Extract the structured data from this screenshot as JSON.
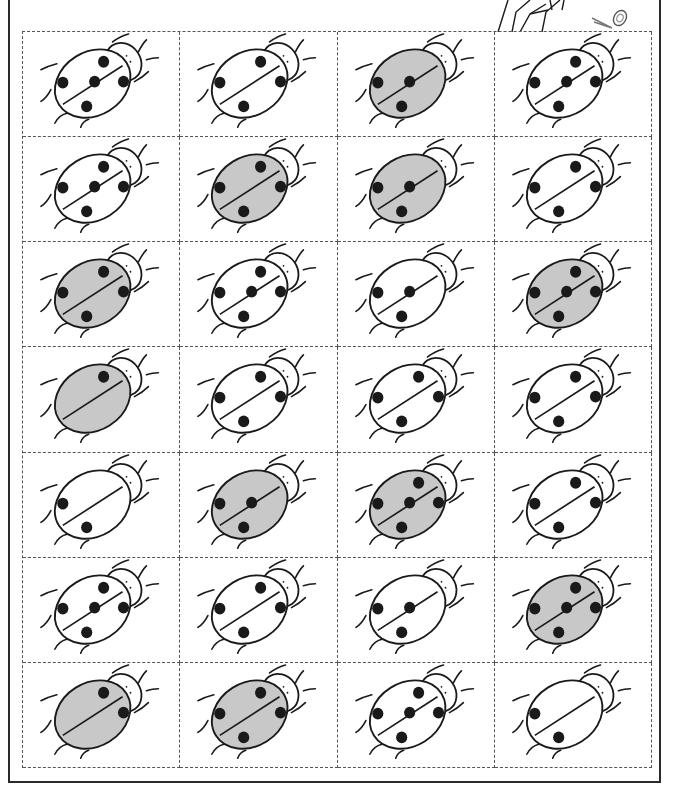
{
  "worksheet": {
    "title": "",
    "colors": {
      "ink": "#1a1a1a",
      "shaded_fill": "#c8c8c8",
      "plain_fill": "#ffffff",
      "dash_line": "#555555"
    },
    "decoration": "scissors-cut-here",
    "grid": {
      "rows": 7,
      "columns": 4
    },
    "cards": [
      [
        {
          "spots": 5,
          "shaded": false
        },
        {
          "spots": 4,
          "shaded": false
        },
        {
          "spots": 3,
          "shaded": true
        },
        {
          "spots": 5,
          "shaded": false
        }
      ],
      [
        {
          "spots": 5,
          "shaded": false
        },
        {
          "spots": 4,
          "shaded": true
        },
        {
          "spots": 3,
          "shaded": true
        },
        {
          "spots": 4,
          "shaded": false
        }
      ],
      [
        {
          "spots": 4,
          "shaded": true
        },
        {
          "spots": 5,
          "shaded": false
        },
        {
          "spots": 3,
          "shaded": false
        },
        {
          "spots": 5,
          "shaded": true
        }
      ],
      [
        {
          "spots": 1,
          "shaded": true
        },
        {
          "spots": 4,
          "shaded": false
        },
        {
          "spots": 4,
          "shaded": false
        },
        {
          "spots": 4,
          "shaded": false
        }
      ],
      [
        {
          "spots": 2,
          "shaded": false
        },
        {
          "spots": 3,
          "shaded": true
        },
        {
          "spots": 5,
          "shaded": true
        },
        {
          "spots": 4,
          "shaded": false
        }
      ],
      [
        {
          "spots": 5,
          "shaded": false
        },
        {
          "spots": 4,
          "shaded": false
        },
        {
          "spots": 3,
          "shaded": false
        },
        {
          "spots": 5,
          "shaded": true
        }
      ],
      [
        {
          "spots": 2,
          "shaded": true
        },
        {
          "spots": 4,
          "shaded": true
        },
        {
          "spots": 5,
          "shaded": false
        },
        {
          "spots": 2,
          "shaded": false
        }
      ]
    ]
  }
}
